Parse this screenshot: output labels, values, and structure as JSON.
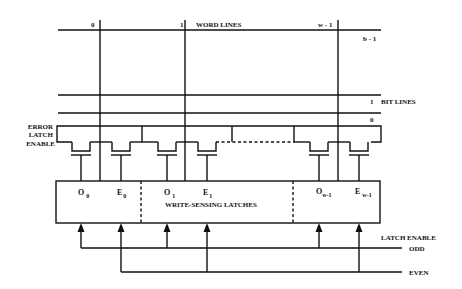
{
  "diagram": {
    "word_lines": {
      "title": "WORD LINES",
      "labels": [
        "0",
        "1",
        "w - 1"
      ],
      "last_bit_label": "b - 1"
    },
    "bit_lines": {
      "title": "BIT LINES",
      "labels": [
        "1",
        "0"
      ]
    },
    "error_latch_enable": {
      "line1": "ERROR",
      "line2": "LATCH",
      "line3": "ENABLE"
    },
    "latches": {
      "title": "WRITE-SENSING LATCHES",
      "cells": [
        {
          "base": "O",
          "sub": "0"
        },
        {
          "base": "E",
          "sub": "0"
        },
        {
          "base": "O",
          "sub": "1"
        },
        {
          "base": "E",
          "sub": "1"
        },
        {
          "base": "O",
          "sub": "w-1"
        },
        {
          "base": "E",
          "sub": "w-1"
        }
      ]
    },
    "latch_enable": {
      "title": "LATCH ENABLE",
      "odd": "ODD",
      "even": "EVEN"
    },
    "colors": {
      "ink": "#111111",
      "background": "#ffffff"
    }
  }
}
